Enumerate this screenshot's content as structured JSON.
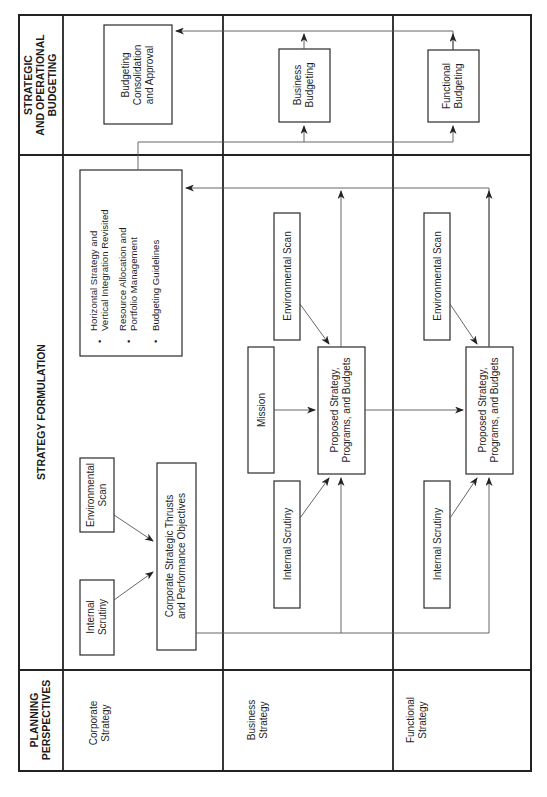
{
  "diagram": {
    "orientation": "rotated-90-ccw",
    "columns": {
      "planning_perspectives": [
        "PLANNING",
        "PERSPECTIVES"
      ],
      "strategy_formulation": "STRATEGY FORMULATION",
      "strategic_operational_budgeting": [
        "STRATEGIC",
        "AND OPERATIONAL",
        "BUDGETING"
      ]
    },
    "rows": {
      "corporate": [
        "Corporate",
        "Strategy"
      ],
      "business": [
        "Business",
        "Strategy"
      ],
      "functional": [
        "Functional",
        "Strategy"
      ]
    },
    "corporate_row": {
      "internal_scrutiny": [
        "Internal",
        "Scrutiny"
      ],
      "environmental_scan": [
        "Environmental",
        "Scan"
      ],
      "thrusts": [
        "Corporate Strategic Thrusts",
        "and Performance Objectives"
      ],
      "guidelines": {
        "bullets": [
          [
            "Horizontal Strategy and",
            "Vertical Integration Revisited"
          ],
          [
            "Resource Allocation and",
            "Portfolio Management"
          ],
          [
            "Budgeting Guidelines"
          ]
        ],
        "bullet_glyph": "•"
      },
      "budgeting": [
        "Budgeting",
        "Consolidation",
        "and Approval"
      ]
    },
    "business_row": {
      "internal_scrutiny": "Internal Scrutiny",
      "mission": "Mission",
      "environmental_scan": "Environmental Scan",
      "proposed": [
        "Proposed Strategy,",
        "Programs, and Budgets"
      ],
      "budgeting": [
        "Business",
        "Budgeting"
      ]
    },
    "functional_row": {
      "internal_scrutiny": "Internal Scrutiny",
      "environmental_scan": "Environmental Scan",
      "proposed": [
        "Proposed Strategy,",
        "Programs, and Budgets"
      ],
      "budgeting": [
        "Functional",
        "Budgeting"
      ]
    }
  }
}
